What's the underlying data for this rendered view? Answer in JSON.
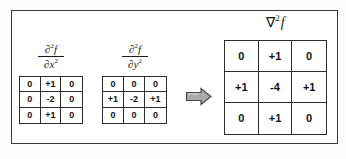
{
  "figure": {
    "title_visible": false,
    "background_color": "#ffffff",
    "frame_color": "#3a3a3a",
    "text_color": "#111111",
    "arrow_color": "#a8a8a8",
    "arrow_outline_color": "#4d4d4d"
  },
  "kernels": {
    "d2f_dx2": {
      "label": {
        "numerator": "∂",
        "numerator_sup": "2",
        "numerator_var": "f",
        "denominator": "∂x",
        "denominator_sup": "2",
        "plain": "∂2f/∂x2"
      },
      "rows": [
        [
          "0",
          "+1",
          "0"
        ],
        [
          "0",
          "-2",
          "0"
        ],
        [
          "0",
          "+1",
          "0"
        ]
      ]
    },
    "d2f_dy2": {
      "label": {
        "numerator": "∂",
        "numerator_sup": "2",
        "numerator_var": "f",
        "denominator": "∂y",
        "denominator_sup": "2",
        "plain": "∂2f/∂y2"
      },
      "rows": [
        [
          "0",
          "0",
          "0"
        ],
        [
          "+1",
          "-2",
          "+1"
        ],
        [
          "0",
          "0",
          "0"
        ]
      ]
    },
    "laplacian": {
      "label": {
        "symbol": "∇",
        "sup": "2",
        "var": "f",
        "plain": "∇2f"
      },
      "rows": [
        [
          "0",
          "+1",
          "0"
        ],
        [
          "+1",
          "-4",
          "+1"
        ],
        [
          "0",
          "+1",
          "0"
        ]
      ]
    }
  },
  "arrow": {
    "icon": "right-block-arrow-icon",
    "direction": "right"
  }
}
